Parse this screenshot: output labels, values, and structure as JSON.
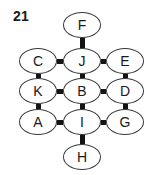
{
  "figure": {
    "number_label": "21",
    "type": "node-link-diagram",
    "width": 157,
    "height": 175,
    "background_color": "#ffffff",
    "node_fill_color": "#ffffff",
    "node_stroke_color": "#3a3a3a",
    "edge_color": "#141414",
    "text_color": "#1a1a1a"
  },
  "nodes": [
    {
      "id": "F",
      "label": "F",
      "x": 82,
      "y": 25,
      "row": 0,
      "col": 1
    },
    {
      "id": "C",
      "label": "C",
      "x": 38,
      "y": 61,
      "row": 1,
      "col": 0
    },
    {
      "id": "J",
      "label": "J",
      "x": 82,
      "y": 61,
      "row": 1,
      "col": 1
    },
    {
      "id": "E",
      "label": "E",
      "x": 125,
      "y": 61,
      "row": 1,
      "col": 2
    },
    {
      "id": "K",
      "label": "K",
      "x": 38,
      "y": 91,
      "row": 2,
      "col": 0
    },
    {
      "id": "B",
      "label": "B",
      "x": 82,
      "y": 91,
      "row": 2,
      "col": 1
    },
    {
      "id": "D",
      "label": "D",
      "x": 125,
      "y": 91,
      "row": 2,
      "col": 2
    },
    {
      "id": "A",
      "label": "A",
      "x": 38,
      "y": 122,
      "row": 3,
      "col": 0
    },
    {
      "id": "I",
      "label": "I",
      "x": 82,
      "y": 122,
      "row": 3,
      "col": 1
    },
    {
      "id": "G",
      "label": "G",
      "x": 125,
      "y": 122,
      "row": 3,
      "col": 2
    },
    {
      "id": "H",
      "label": "H",
      "x": 82,
      "y": 157,
      "row": 4,
      "col": 1
    }
  ],
  "edges": [
    {
      "from": "F",
      "to": "J",
      "orientation": "vertical",
      "x": 82,
      "y1": 38,
      "y2": 48
    },
    {
      "from": "C",
      "to": "J",
      "orientation": "horizontal",
      "y": 61,
      "x1": 57,
      "x2": 63
    },
    {
      "from": "J",
      "to": "E",
      "orientation": "horizontal",
      "y": 61,
      "x1": 101,
      "x2": 106
    },
    {
      "from": "C",
      "to": "K",
      "orientation": "vertical",
      "x": 38,
      "y1": 74,
      "y2": 78
    },
    {
      "from": "J",
      "to": "B",
      "orientation": "vertical",
      "x": 82,
      "y1": 74,
      "y2": 78
    },
    {
      "from": "E",
      "to": "D",
      "orientation": "vertical",
      "x": 125,
      "y1": 74,
      "y2": 78
    },
    {
      "from": "K",
      "to": "B",
      "orientation": "horizontal",
      "y": 91,
      "x1": 57,
      "x2": 63
    },
    {
      "from": "B",
      "to": "D",
      "orientation": "horizontal",
      "y": 91,
      "x1": 101,
      "x2": 106
    },
    {
      "from": "K",
      "to": "A",
      "orientation": "vertical",
      "x": 38,
      "y1": 104,
      "y2": 109
    },
    {
      "from": "B",
      "to": "I",
      "orientation": "vertical",
      "x": 82,
      "y1": 104,
      "y2": 109
    },
    {
      "from": "D",
      "to": "G",
      "orientation": "vertical",
      "x": 125,
      "y1": 104,
      "y2": 109
    },
    {
      "from": "A",
      "to": "I",
      "orientation": "horizontal",
      "y": 122,
      "x1": 57,
      "x2": 63
    },
    {
      "from": "I",
      "to": "G",
      "orientation": "horizontal",
      "y": 122,
      "x1": 101,
      "x2": 106
    },
    {
      "from": "I",
      "to": "H",
      "orientation": "vertical",
      "x": 82,
      "y1": 135,
      "y2": 144
    }
  ]
}
